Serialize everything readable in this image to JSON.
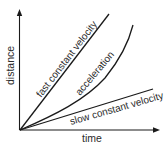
{
  "diagram": {
    "title": "",
    "type": "distance-time graph",
    "axes": {
      "x_label": "time",
      "y_label": "distance"
    },
    "lines": [
      {
        "name": "fast-constant-velocity",
        "label": "fast constant velocity",
        "shape": "straight line, steep slope"
      },
      {
        "name": "acceleration",
        "label": "acceleration",
        "shape": "upward curve"
      },
      {
        "name": "slow-constant-velocity",
        "label": "slow constant velocity",
        "shape": "straight line, shallow slope"
      }
    ],
    "colors": {
      "line": "#1a1a1a",
      "text": "#2a2a2a",
      "background": "#ffffff"
    }
  }
}
